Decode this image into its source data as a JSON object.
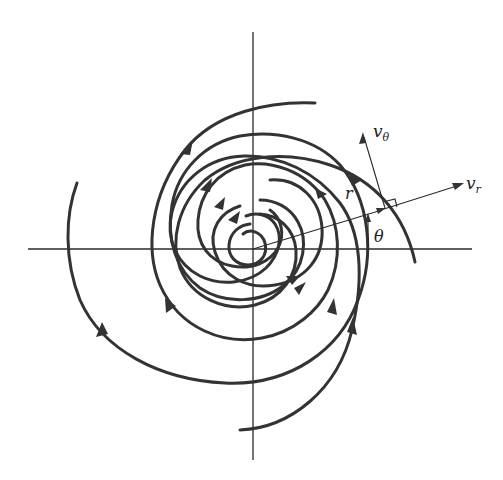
{
  "diagram": {
    "title": "",
    "colors": {
      "curve": "#333333",
      "axis": "#2a2a2a",
      "background": "#ffffff"
    },
    "origin": {
      "x": 253,
      "y": 249
    },
    "axes": {
      "horizontal": {
        "x1": 28,
        "x2": 472,
        "y": 249
      },
      "vertical": {
        "x": 253,
        "y1": 32,
        "y2": 460
      }
    },
    "labels": {
      "radius": "r",
      "angle": "θ",
      "radial_velocity": {
        "base": "v",
        "sub": "r"
      },
      "tangential_velocity": {
        "base": "v",
        "sub": "θ"
      }
    },
    "trajectory_direction": "counterclockwise, spiraling inward",
    "trajectory_count": 6
  }
}
